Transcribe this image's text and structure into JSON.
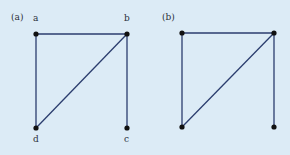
{
  "figure": {
    "background": "#dcebf6",
    "edge_color": "#2b3d6e",
    "node_color": "#111111",
    "panels": [
      {
        "id": "a",
        "label": "(a)",
        "nodes": [
          {
            "id": "a",
            "label": "a",
            "x": 36,
            "y": 34
          },
          {
            "id": "b",
            "label": "b",
            "x": 127,
            "y": 34
          },
          {
            "id": "c",
            "label": "c",
            "x": 127,
            "y": 128
          },
          {
            "id": "d",
            "label": "d",
            "x": 36,
            "y": 128
          }
        ],
        "edges": [
          [
            "a",
            "b"
          ],
          [
            "a",
            "d"
          ],
          [
            "b",
            "d"
          ],
          [
            "b",
            "c"
          ]
        ]
      },
      {
        "id": "b",
        "label": "(b)",
        "nodes": [
          {
            "id": "tl",
            "label": "",
            "x": 182,
            "y": 33
          },
          {
            "id": "tr",
            "label": "",
            "x": 274,
            "y": 33
          },
          {
            "id": "br",
            "label": "",
            "x": 274,
            "y": 127
          },
          {
            "id": "bl",
            "label": "",
            "x": 182,
            "y": 127
          }
        ],
        "edges": [
          [
            "tl",
            "tr"
          ],
          [
            "tl",
            "bl"
          ],
          [
            "tr",
            "bl"
          ],
          [
            "tr",
            "br"
          ]
        ]
      }
    ]
  }
}
